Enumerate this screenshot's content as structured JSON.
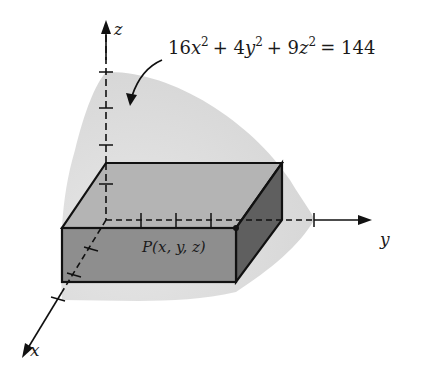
{
  "diagram": {
    "type": "3d-geometry",
    "equation": {
      "coef_x": "16",
      "var_x": "x",
      "plus1": "+ 4",
      "var_y": "y",
      "plus2": "+ 9",
      "var_z": "z",
      "exp": "2",
      "rhs": "= 144"
    },
    "axes": {
      "x_label": "x",
      "y_label": "y",
      "z_label": "z"
    },
    "point_label": "P(x, y, z)",
    "colors": {
      "ellipsoid_fill": "#d9d9d9",
      "box_top": "#b5b5b5",
      "box_front": "#8f8f8f",
      "box_side": "#5e5e5e",
      "stroke": "#111111"
    }
  }
}
